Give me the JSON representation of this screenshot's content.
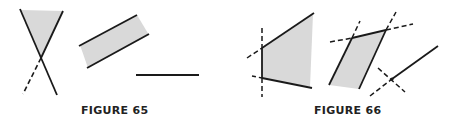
{
  "figures": [
    {
      "id": "figure-65",
      "caption": "FIGURE 65",
      "parts": [
        {
          "name": "crossing-lines-with-shaded-wedge",
          "description": "two lines crossing in an X; region between upper arms shaded; lower-left arm dashed"
        },
        {
          "name": "parallel-lines-shaded-strip",
          "description": "two parallel slanted solid lines with shaded strip between"
        },
        {
          "name": "horizontal-segment",
          "description": "single horizontal solid segment"
        }
      ]
    },
    {
      "id": "figure-66",
      "caption": "FIGURE 66",
      "parts": [
        {
          "name": "shaded-trapezoid-region",
          "description": "region bounded by a vertical line and two slanted lines, extensions dashed"
        },
        {
          "name": "shaded-parallelogram",
          "description": "parallelogram with sides extended as dashed lines"
        },
        {
          "name": "ray-with-crossing-dashed-line",
          "description": "solid ray with dashed extension crossed by a dashed line"
        }
      ]
    }
  ],
  "colors": {
    "line": "#1a1a1a",
    "shade": "#d9d9d9",
    "background": "#ffffff"
  }
}
